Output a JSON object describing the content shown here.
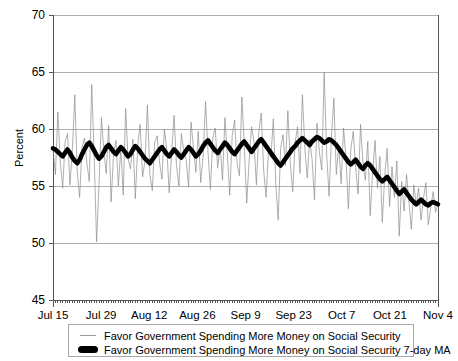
{
  "chart_data": {
    "type": "line",
    "title": "",
    "xlabel": "",
    "ylabel": "Percent",
    "ylim": [
      45,
      70
    ],
    "yticks": [
      45,
      50,
      55,
      60,
      65,
      70
    ],
    "ytick_labels": [
      "45",
      "50",
      "55",
      "60",
      "65",
      "70"
    ],
    "grid": true,
    "grid_axis": "y",
    "legend_position": "below-plot",
    "x_major_labels": [
      "Jul 15",
      "Jul 29",
      "Aug 12",
      "Aug 26",
      "Sep 9",
      "Sep 23",
      "Oct 7",
      "Oct 21",
      "Nov 4"
    ],
    "x_major_interval_days": 14,
    "x_minor_tick_interval_days": 1,
    "x_range": [
      "Jul 15",
      "Nov 4"
    ],
    "colors": {
      "daily_series": "#8c8c8c",
      "moving_average": "#000000",
      "gridline": "#b0b0b0",
      "axis": "#555555",
      "background": "#ffffff"
    },
    "series": [
      {
        "name": "Favor Government Spending More Money on Social Security",
        "style": "thin-line",
        "color": "#8c8c8c",
        "values": [
          58.3,
          56.0,
          61.5,
          57.2,
          54.8,
          58.9,
          59.6,
          55.1,
          58.2,
          63.0,
          56.3,
          54.0,
          58.4,
          59.2,
          57.0,
          55.4,
          63.9,
          57.6,
          50.1,
          55.2,
          61.0,
          58.0,
          56.1,
          60.3,
          53.6,
          57.8,
          59.0,
          55.0,
          58.3,
          54.2,
          61.8,
          57.4,
          56.5,
          59.1,
          53.9,
          58.6,
          60.4,
          55.8,
          57.2,
          62.1,
          56.0,
          54.6,
          58.8,
          59.4,
          57.1,
          55.6,
          60.0,
          58.2,
          54.4,
          57.9,
          61.2,
          56.8,
          55.0,
          59.6,
          58.1,
          57.3,
          54.9,
          60.6,
          58.4,
          56.2,
          59.8,
          55.3,
          57.6,
          62.4,
          58.0,
          54.7,
          59.2,
          60.1,
          56.6,
          58.5,
          55.5,
          61.0,
          57.8,
          54.2,
          59.4,
          60.8,
          57.0,
          55.9,
          62.8,
          58.6,
          53.5,
          57.2,
          60.2,
          58.9,
          55.1,
          59.7,
          61.4,
          56.4,
          54.0,
          58.1,
          57.5,
          60.9,
          55.2,
          52.0,
          58.3,
          59.5,
          56.8,
          61.6,
          57.0,
          54.5,
          58.8,
          60.2,
          56.1,
          63.0,
          58.4,
          55.7,
          59.1,
          57.3,
          53.8,
          60.5,
          58.0,
          56.4,
          65.0,
          57.9,
          54.1,
          59.3,
          62.7,
          56.0,
          58.6,
          55.2,
          60.1,
          57.4,
          53.0,
          58.2,
          59.8,
          56.6,
          54.3,
          60.4,
          57.1,
          55.5,
          58.9,
          52.4,
          56.2,
          59.0,
          54.8,
          57.6,
          51.8,
          55.9,
          58.3,
          53.2,
          56.7,
          54.0,
          57.2,
          50.6,
          55.4,
          52.8,
          56.0,
          53.6,
          51.2,
          55.1,
          53.4,
          54.8,
          52.0,
          53.9,
          55.3,
          51.6,
          53.1,
          54.5,
          52.7,
          53.5
        ]
      },
      {
        "name": "Favor Government Spending More Money on Social Security 7-day MA",
        "style": "thick-line",
        "color": "#000000",
        "values": [
          58.3,
          58.2,
          58.0,
          57.8,
          57.6,
          57.9,
          58.2,
          57.9,
          57.5,
          57.2,
          57.0,
          57.3,
          57.8,
          58.2,
          58.6,
          58.8,
          58.5,
          58.1,
          57.7,
          57.4,
          57.6,
          58.0,
          58.4,
          58.6,
          58.3,
          58.0,
          57.8,
          58.1,
          58.4,
          58.2,
          57.9,
          57.6,
          57.8,
          58.2,
          58.5,
          58.3,
          58.0,
          57.7,
          57.4,
          57.2,
          57.0,
          57.3,
          57.6,
          57.9,
          58.2,
          58.4,
          58.1,
          57.8,
          57.6,
          57.9,
          58.2,
          58.0,
          57.7,
          57.5,
          57.8,
          58.1,
          58.4,
          58.2,
          57.9,
          57.6,
          57.8,
          58.1,
          58.5,
          58.8,
          59.0,
          58.7,
          58.4,
          58.1,
          57.9,
          58.2,
          58.5,
          58.8,
          58.6,
          58.3,
          58.0,
          57.8,
          58.1,
          58.4,
          58.7,
          58.9,
          58.6,
          58.3,
          58.0,
          58.3,
          58.6,
          58.9,
          59.1,
          58.8,
          58.5,
          58.2,
          57.9,
          57.6,
          57.3,
          57.0,
          56.8,
          57.1,
          57.4,
          57.7,
          58.0,
          58.3,
          58.5,
          58.8,
          59.0,
          59.2,
          59.0,
          58.8,
          58.6,
          58.9,
          59.1,
          59.3,
          59.2,
          59.0,
          58.8,
          58.9,
          59.1,
          59.0,
          58.8,
          58.6,
          58.3,
          58.0,
          57.7,
          57.4,
          57.1,
          56.9,
          57.1,
          57.3,
          57.0,
          56.7,
          56.5,
          56.8,
          57.0,
          56.8,
          56.5,
          56.2,
          55.9,
          55.6,
          55.4,
          55.6,
          55.8,
          55.5,
          55.2,
          54.9,
          54.6,
          54.3,
          54.5,
          54.7,
          54.4,
          54.1,
          53.8,
          53.6,
          53.4,
          53.6,
          53.8,
          53.6,
          53.4,
          53.3,
          53.5,
          53.6,
          53.5,
          53.4
        ]
      }
    ]
  },
  "legend": {
    "entries": [
      {
        "label": "Favor Government Spending More Money on Social Security",
        "marker": "thin-line-marker"
      },
      {
        "label": "Favor Government Spending More Money on Social Security 7-day MA",
        "marker": "thick-line-marker"
      }
    ]
  }
}
